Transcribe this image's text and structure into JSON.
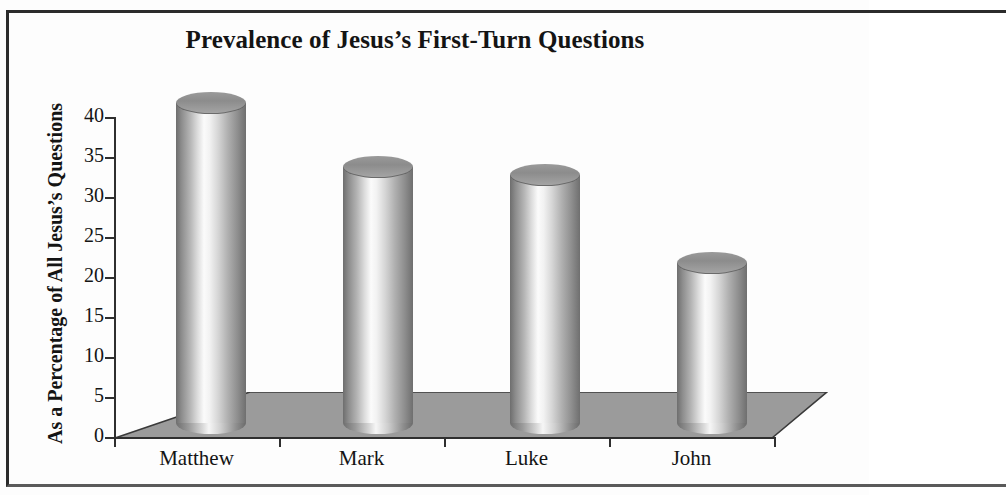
{
  "figure": {
    "title": "Prevalence of Jesus’s First-Turn Questions"
  },
  "chart_data": {
    "type": "bar",
    "title": "Prevalence of Jesus’s First-Turn Questions",
    "subtitle": "",
    "xlabel": "",
    "ylabel": "As a Percentage of All Jesus’s Questions",
    "categories": [
      "Matthew",
      "Mark",
      "Luke",
      "John"
    ],
    "values": [
      40,
      32,
      31,
      20
    ],
    "series": [
      {
        "name": "As a Percentage of All Jesus’s Questions",
        "values": [
          40,
          32,
          31,
          20
        ]
      }
    ],
    "ylim": [
      0,
      40
    ],
    "ytick_labels": [
      "0",
      "5",
      "10",
      "15",
      "20",
      "25",
      "30",
      "35",
      "40"
    ],
    "ytick_values": [
      0,
      5,
      10,
      15,
      20,
      25,
      30,
      35,
      40
    ],
    "grid": false,
    "legend": false,
    "legend_position": "none",
    "style": "3d-cylinder-grayscale",
    "colors": {
      "bar_dark": "#6e6e6e",
      "bar_light": "#fbfbfb",
      "bar_top": "#8c8c8c",
      "floor": "#9b9b9b",
      "axis": "#2f2f2f",
      "text": "#141414",
      "background": "#fdfdfd",
      "frame": "#2b2b2b"
    }
  }
}
